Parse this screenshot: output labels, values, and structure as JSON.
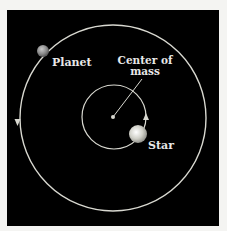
{
  "diagram": {
    "labels": {
      "planet": "Planet",
      "center_line1": "Center of",
      "center_line2": "mass",
      "star": "Star"
    },
    "colors": {
      "background": "#000000",
      "frame": "#f4f4f2",
      "orbit": "#d8d8d0",
      "label": "#e8e8e8"
    }
  }
}
